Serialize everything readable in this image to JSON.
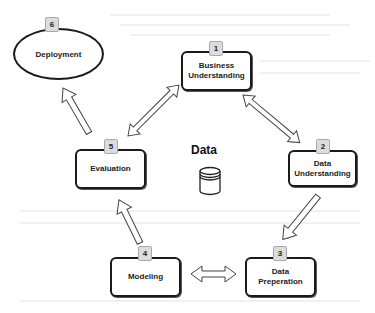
{
  "diagram": {
    "center": {
      "label": "Data",
      "icon": "database-cylinder-icon"
    },
    "stages": [
      {
        "number": "1",
        "label_line1": "Business",
        "label_line2": "Understanding",
        "shape": "rounded-rect"
      },
      {
        "number": "2",
        "label_line1": "Data",
        "label_line2": "Understanding",
        "shape": "rounded-rect"
      },
      {
        "number": "3",
        "label_line1": "Data",
        "label_line2": "Preperation",
        "shape": "rounded-rect"
      },
      {
        "number": "4",
        "label_line1": "Modeling",
        "label_line2": "",
        "shape": "rounded-rect"
      },
      {
        "number": "5",
        "label_line1": "Evaluation",
        "label_line2": "",
        "shape": "rounded-rect"
      },
      {
        "number": "6",
        "label_line1": "Deployment",
        "label_line2": "",
        "shape": "ellipse"
      }
    ],
    "connections": [
      {
        "from": "1",
        "to": "2",
        "type": "bidirectional"
      },
      {
        "from": "2",
        "to": "3",
        "type": "one-way"
      },
      {
        "from": "3",
        "to": "4",
        "type": "bidirectional"
      },
      {
        "from": "4",
        "to": "5",
        "type": "one-way"
      },
      {
        "from": "5",
        "to": "1",
        "type": "bidirectional"
      },
      {
        "from": "5",
        "to": "6",
        "type": "one-way"
      }
    ]
  }
}
